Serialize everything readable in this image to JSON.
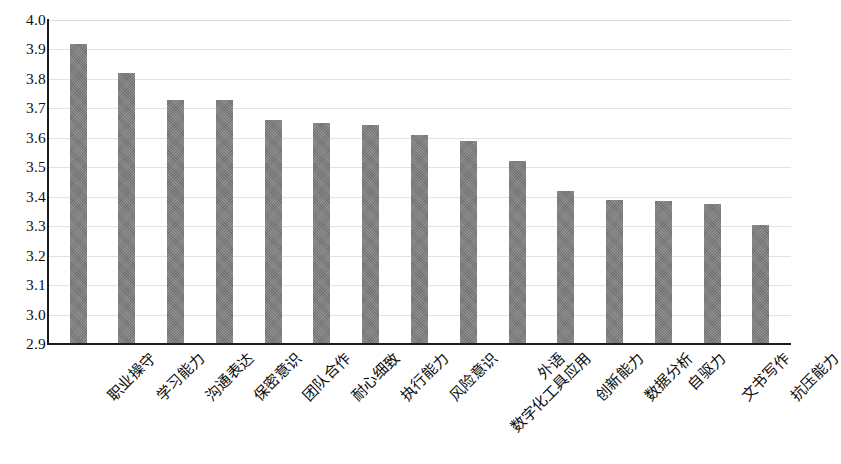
{
  "chart_data": {
    "type": "bar",
    "title": "",
    "subtitle": "",
    "xlabel": "",
    "ylabel": "",
    "ylim": [
      2.9,
      4.0
    ],
    "y_ticks": [
      "2.9",
      "3.0",
      "3.1",
      "3.2",
      "3.3",
      "3.4",
      "3.5",
      "3.6",
      "3.7",
      "3.8",
      "3.9",
      "4.0"
    ],
    "y_tick_values": [
      2.9,
      3.0,
      3.1,
      3.2,
      3.3,
      3.4,
      3.5,
      3.6,
      3.7,
      3.8,
      3.9,
      4.0
    ],
    "grid": true,
    "grid_axis": "y",
    "legend": false,
    "legend_position": "none",
    "bar_color": "#7b7b7b",
    "grid_color": "#e2e2e2",
    "axis_color": "#1d1d1d",
    "background_color": "#ffffff",
    "categories": [
      "职业操守",
      "学习能力",
      "沟通表达",
      "保密意识",
      "团队合作",
      "耐心细致",
      "执行能力",
      "风险意识",
      "数字化工具应用",
      "外语",
      "创新能力",
      "数据分析",
      "自驱力",
      "文书写作",
      "抗压能力"
    ],
    "values": [
      3.92,
      3.82,
      3.73,
      3.73,
      3.66,
      3.65,
      3.645,
      3.61,
      3.59,
      3.52,
      3.42,
      3.39,
      3.385,
      3.375,
      3.305
    ]
  }
}
